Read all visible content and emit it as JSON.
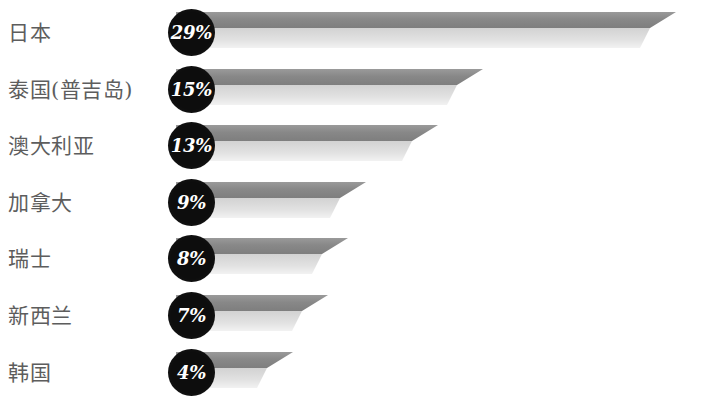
{
  "chart_data": {
    "type": "bar",
    "orientation": "horizontal",
    "title": "",
    "subtitle": "",
    "xlabel": "",
    "ylabel": "",
    "grid": false,
    "legend": null,
    "value_suffix": "%",
    "xlim": [
      0,
      29
    ],
    "categories": [
      "日本",
      "泰国(普吉岛)",
      "澳大利亚",
      "加拿大",
      "瑞士",
      "新西兰",
      "韩国"
    ],
    "values": [
      29,
      15,
      13,
      9,
      8,
      7,
      4
    ],
    "value_labels": [
      "29%",
      "15%",
      "13%",
      "9%",
      "8%",
      "7%",
      "4%"
    ],
    "series": [
      {
        "name": "",
        "values": [
          29,
          15,
          13,
          9,
          8,
          7,
          4
        ]
      }
    ]
  },
  "colors": {
    "background": "#ffffff",
    "label_text": "#5d5d5d",
    "badge_fill": "#0d0d0d",
    "badge_text": "#ffffff",
    "bar_top": "#8f8f8f",
    "bar_bottom": "#dcdcdc"
  },
  "rows": [
    {
      "label": "日本",
      "value": 29,
      "value_label": "29%",
      "bar_end_px": 676
    },
    {
      "label": "泰国(普吉岛)",
      "value": 15,
      "value_label": "15%",
      "bar_end_px": 483
    },
    {
      "label": "澳大利亚",
      "value": 13,
      "value_label": "13%",
      "bar_end_px": 438
    },
    {
      "label": "加拿大",
      "value": 9,
      "value_label": "9%",
      "bar_end_px": 366
    },
    {
      "label": "瑞士",
      "value": 8,
      "value_label": "8%",
      "bar_end_px": 348
    },
    {
      "label": "新西兰",
      "value": 7,
      "value_label": "7%",
      "bar_end_px": 328
    },
    {
      "label": "韩国",
      "value": 4,
      "value_label": "4%",
      "bar_end_px": 293
    }
  ]
}
